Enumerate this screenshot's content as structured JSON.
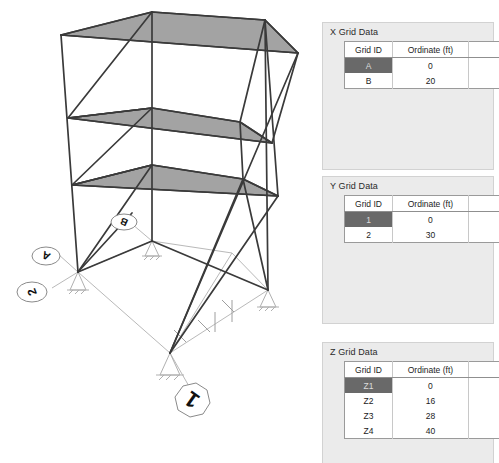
{
  "model_view": {
    "name": "3D structural frame model",
    "slab_fill": "#a3a3a3",
    "member_color": "#3a3a3a",
    "gridline_color": "#b9b9b9",
    "bubbles": [
      {
        "id": "bubble-A",
        "label": "A",
        "axis": "X",
        "shape": "rounded"
      },
      {
        "id": "bubble-B",
        "label": "B",
        "axis": "X",
        "shape": "rounded"
      },
      {
        "id": "bubble-2",
        "label": "2",
        "axis": "Y",
        "shape": "rounded"
      },
      {
        "id": "bubble-1",
        "label": "1",
        "axis": "Y",
        "shape": "octagon"
      }
    ]
  },
  "panels": {
    "x": {
      "title": "X Grid Data",
      "columns": [
        "Grid ID",
        "Ordinate (ft)"
      ],
      "rows": [
        {
          "grid_id": "A",
          "ordinate": "0",
          "selected": true
        },
        {
          "grid_id": "B",
          "ordinate": "20",
          "selected": false
        }
      ]
    },
    "y": {
      "title": "Y Grid Data",
      "columns": [
        "Grid ID",
        "Ordinate (ft)"
      ],
      "rows": [
        {
          "grid_id": "1",
          "ordinate": "0",
          "selected": true
        },
        {
          "grid_id": "2",
          "ordinate": "30",
          "selected": false
        }
      ]
    },
    "z": {
      "title": "Z Grid Data",
      "columns": [
        "Grid ID",
        "Ordinate (ft)"
      ],
      "rows": [
        {
          "grid_id": "Z1",
          "ordinate": "0",
          "selected": true
        },
        {
          "grid_id": "Z2",
          "ordinate": "16",
          "selected": false
        },
        {
          "grid_id": "Z3",
          "ordinate": "28",
          "selected": false
        },
        {
          "grid_id": "Z4",
          "ordinate": "40",
          "selected": false
        }
      ]
    }
  }
}
